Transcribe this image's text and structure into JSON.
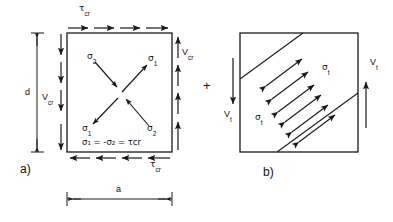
{
  "figure": {
    "background": "#ffffff",
    "line_color": "#1a1a1a",
    "width": 393,
    "height": 222
  },
  "panels": [
    {
      "id": "a",
      "label": "a)",
      "description": "Square web panel in pure shear at the critical load, with principal stresses shown along the diagonals",
      "box": {
        "x": 67,
        "y": 33,
        "w": 105,
        "h": 119
      },
      "edge_loads": [
        {
          "name": "top-shear",
          "label": "τ",
          "sub": "cr",
          "direction": "right",
          "arrows": 4
        },
        {
          "name": "bottom-shear",
          "label": "τ",
          "sub": "cr",
          "direction": "left",
          "arrows": 4
        },
        {
          "name": "left-shear",
          "label": "V",
          "sub": "cr",
          "direction": "down",
          "arrows": 4
        },
        {
          "name": "right-shear",
          "label": "V",
          "sub": "cr",
          "direction": "up",
          "arrows": 4
        }
      ],
      "principal_stresses": [
        {
          "name": "sigma-2-upper-left",
          "label": "σ",
          "sub": "2",
          "sense": "compression",
          "direction": "inward",
          "corner": "upper-left"
        },
        {
          "name": "sigma-1-upper-right",
          "label": "σ",
          "sub": "1",
          "sense": "tension",
          "direction": "outward",
          "corner": "upper-right"
        },
        {
          "name": "sigma-1-lower-left",
          "label": "σ",
          "sub": "1",
          "sense": "tension",
          "direction": "outward",
          "corner": "lower-left"
        },
        {
          "name": "sigma-2-lower-right",
          "label": "σ",
          "sub": "2",
          "sense": "compression",
          "direction": "inward",
          "corner": "lower-right"
        }
      ],
      "equation": "σ₁ = -σ₂ = τcr",
      "dimensions": [
        {
          "name": "height-dimension",
          "label": "d",
          "orientation": "vertical"
        },
        {
          "name": "width-dimension",
          "label": "a",
          "orientation": "horizontal"
        }
      ]
    },
    {
      "id": "b",
      "label": "b)",
      "description": "Diagonal tension field band across the panel with membrane tension stresses",
      "box": {
        "x": 240,
        "y": 33,
        "w": 118,
        "h": 119
      },
      "edge_loads": [
        {
          "name": "left-shear",
          "label": "V",
          "sub": "t",
          "direction": "down",
          "arrows": 1
        },
        {
          "name": "right-shear",
          "label": "V",
          "sub": "t",
          "direction": "up",
          "arrows": 1
        }
      ],
      "field_labels": [
        {
          "name": "sigma-t-upper",
          "label": "σ",
          "sub": "t"
        },
        {
          "name": "sigma-t-lower",
          "label": "σ",
          "sub": "t"
        }
      ],
      "tension_band": {
        "lines": 2,
        "arrows": 6,
        "arrow_style": "double-headed",
        "orientation": "diagonal-up-right"
      }
    }
  ],
  "operator": {
    "name": "plus-operator",
    "label": "+"
  }
}
